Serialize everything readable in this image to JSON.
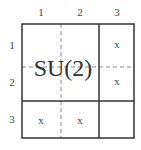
{
  "diagram": {
    "group_label": "SU(2)",
    "column_labels": [
      "1",
      "2",
      "3"
    ],
    "row_labels": [
      "1",
      "2",
      "3"
    ],
    "cells": [
      [
        "",
        "",
        "x"
      ],
      [
        "",
        "",
        "x"
      ],
      [
        "x",
        "x",
        ""
      ]
    ],
    "block": {
      "rows": [
        1,
        2
      ],
      "cols": [
        1,
        2
      ],
      "label": "SU(2)"
    },
    "colors": {
      "solid_line": "#333333",
      "dashed_line": "#888888",
      "text": "#444444",
      "background": "#ffffff"
    }
  }
}
